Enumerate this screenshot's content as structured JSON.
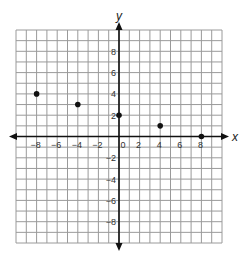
{
  "chart_data": {
    "type": "scatter",
    "title": "",
    "xlabel": "x",
    "ylabel": "y",
    "xlim": [
      -10,
      10
    ],
    "ylim": [
      -10,
      10
    ],
    "grid": true,
    "grid_step": 1,
    "x_ticks": [
      -8,
      -6,
      -4,
      -2,
      0,
      2,
      4,
      6,
      8
    ],
    "y_ticks": [
      -8,
      -6,
      -4,
      -2,
      2,
      4,
      6,
      8
    ],
    "x_tick_labels": [
      "−8",
      "−6",
      "−4",
      "−2",
      "0",
      "2",
      "4",
      "6",
      "8"
    ],
    "y_tick_labels": [
      "−8",
      "−6",
      "−4",
      "−2",
      "2",
      "4",
      "6",
      "8"
    ],
    "points": [
      {
        "x": -8,
        "y": 4
      },
      {
        "x": -4,
        "y": 3
      },
      {
        "x": 0,
        "y": 2
      },
      {
        "x": 4,
        "y": 1
      },
      {
        "x": 8,
        "y": 0
      }
    ],
    "colors": {
      "grid": "#9a9a9a",
      "axis": "#111111",
      "point": "#111111"
    }
  }
}
